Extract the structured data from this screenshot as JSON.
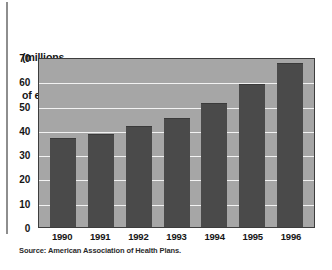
{
  "figure": {
    "left_rule": "vertical-rule",
    "source_note": "Source: American Association of Health Plans."
  },
  "chart_data": {
    "type": "bar",
    "title": "",
    "subtitle": "",
    "xlabel": "",
    "ylabel": "(millions of enrollees)",
    "ylabel_lines": [
      "(millions",
      "of enrollees)"
    ],
    "categories": [
      "1990",
      "1991",
      "1992",
      "1993",
      "1994",
      "1995",
      "1996"
    ],
    "values": [
      36.5,
      38.5,
      41.5,
      45,
      51,
      59,
      67.5
    ],
    "series": [
      {
        "name": "HMO enrollees",
        "values": [
          36.5,
          38.5,
          41.5,
          45,
          51,
          59,
          67.5
        ]
      }
    ],
    "ylim": [
      0,
      70
    ],
    "yticks": [
      0,
      10,
      20,
      30,
      40,
      50,
      60,
      70
    ],
    "ytick_labels": [
      "0",
      "10",
      "20",
      "30",
      "40",
      "50",
      "60",
      "70"
    ],
    "grid": true,
    "grid_axis": "y",
    "legend": false,
    "legend_position": "none",
    "annotations": [],
    "colors": {
      "bar": "#4a4a4a",
      "plot_background": "#a6a6a6",
      "gridline": "#f2f2f2",
      "axis_line": "#3d3d3d",
      "text": "#161616",
      "page_background": "#ffffff",
      "rule": "#8e8e8e"
    }
  }
}
